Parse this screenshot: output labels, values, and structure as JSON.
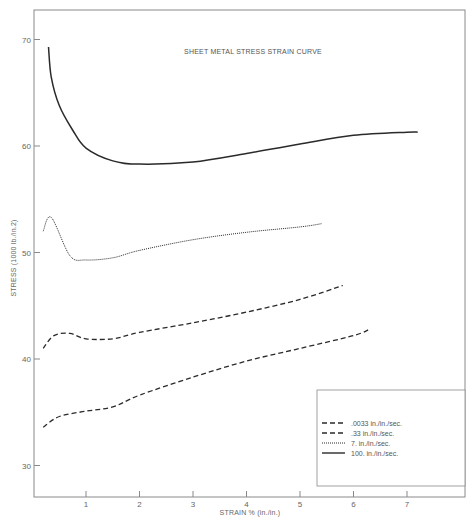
{
  "chart_data": {
    "type": "line",
    "title": "SHEET METAL STRESS STRAIN CURVE",
    "xlabel": "STRAIN % (in./in.)",
    "ylabel": "STRESS (1000 lb./in.2)",
    "xlim": [
      0,
      8
    ],
    "ylim": [
      27,
      73
    ],
    "x_ticks": [
      1,
      2,
      3,
      4,
      5,
      6,
      7
    ],
    "y_ticks": [
      30,
      40,
      50,
      60,
      70
    ],
    "grid": false,
    "legend_position": "lower right",
    "series": [
      {
        "name": ".0033 in./in./sec.",
        "style": "dashed",
        "x": [
          0.2,
          0.5,
          1.0,
          1.5,
          2.0,
          3.0,
          4.0,
          5.0,
          6.0,
          6.3
        ],
        "values": [
          33.6,
          34.6,
          35.1,
          35.5,
          36.6,
          38.3,
          39.8,
          41.0,
          42.2,
          42.8
        ]
      },
      {
        "name": ".33 in./in./sec.",
        "style": "dashed",
        "x": [
          0.2,
          0.4,
          0.7,
          1.0,
          1.5,
          2.0,
          3.0,
          4.0,
          5.0,
          5.8
        ],
        "values": [
          41.0,
          42.2,
          42.4,
          41.9,
          41.9,
          42.5,
          43.4,
          44.4,
          45.6,
          46.9
        ]
      },
      {
        "name": "7. in./in./sec.",
        "style": "dotted",
        "x": [
          0.2,
          0.35,
          0.7,
          1.0,
          1.5,
          2.0,
          3.0,
          4.0,
          5.0,
          5.4
        ],
        "values": [
          52.0,
          53.3,
          49.7,
          49.3,
          49.5,
          50.2,
          51.2,
          51.9,
          52.4,
          52.7
        ]
      },
      {
        "name": "100. in./in./sec.",
        "style": "solid",
        "x": [
          0.3,
          0.35,
          0.5,
          0.75,
          1.0,
          1.5,
          2.0,
          3.0,
          4.0,
          5.0,
          6.0,
          7.0,
          7.2
        ],
        "values": [
          69.3,
          66.5,
          63.8,
          61.5,
          59.8,
          58.6,
          58.3,
          58.5,
          59.3,
          60.2,
          61.0,
          61.3,
          61.3
        ]
      }
    ]
  },
  "labels": {
    "title": "SHEET METAL STRESS STRAIN CURVE",
    "xlabel": "STRAIN % (in./in.)",
    "ylabel": "STRESS (1000 lb./in.2)",
    "x_ticks": [
      "1",
      "2",
      "3",
      "4",
      "5",
      "6",
      "7"
    ],
    "y_ticks": [
      "30",
      "40",
      "50",
      "60",
      "70"
    ],
    "legend": [
      ".0033 in./in./sec.",
      ".33 in./in./sec.",
      "7. in./in./sec.",
      "100. in./in./sec."
    ]
  },
  "colors": {
    "frame": "#8a8a8a",
    "line": "#2a2a2a",
    "text": "#666666"
  }
}
